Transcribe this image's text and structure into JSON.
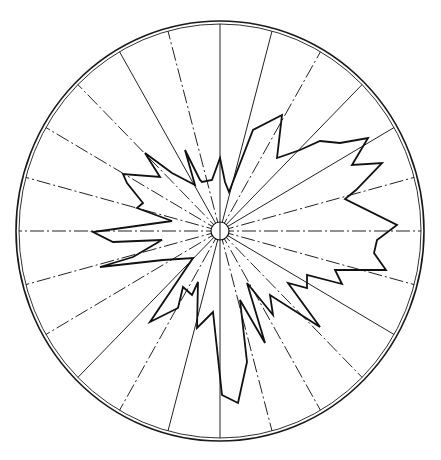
{
  "diagram": {
    "type": "polar-rose-diagram",
    "title": "",
    "center": [
      220,
      231
    ],
    "outer_radius_x": 204,
    "outer_radius_y": 210,
    "inner_ring_gap": 3,
    "hub_radius": 9,
    "spoke_count": 24,
    "spoke_step_deg": 15,
    "spokes_dashed": [
      false,
      false,
      true,
      false,
      false,
      true,
      true,
      true,
      false,
      true,
      true,
      true,
      false,
      false,
      true,
      false,
      true,
      true,
      true,
      true,
      true,
      true,
      false,
      true
    ],
    "colors": {
      "line": "#111111",
      "background": "#ffffff"
    },
    "rose_polygon": [
      [
        220,
        158
      ],
      [
        225,
        182
      ],
      [
        229,
        192
      ],
      [
        253,
        130
      ],
      [
        282,
        115
      ],
      [
        277,
        158
      ],
      [
        300,
        150
      ],
      [
        320,
        141
      ],
      [
        340,
        143
      ],
      [
        368,
        138
      ],
      [
        352,
        165
      ],
      [
        382,
        163
      ],
      [
        356,
        190
      ],
      [
        345,
        199
      ],
      [
        397,
        225
      ],
      [
        377,
        240
      ],
      [
        374,
        253
      ],
      [
        386,
        270
      ],
      [
        335,
        270
      ],
      [
        342,
        284
      ],
      [
        307,
        275
      ],
      [
        307,
        288
      ],
      [
        288,
        283
      ],
      [
        320,
        327
      ],
      [
        270,
        295
      ],
      [
        273,
        315
      ],
      [
        247,
        283
      ],
      [
        265,
        343
      ],
      [
        240,
        300
      ],
      [
        247,
        362
      ],
      [
        238,
        403
      ],
      [
        222,
        395
      ],
      [
        213,
        312
      ],
      [
        197,
        328
      ],
      [
        198,
        282
      ],
      [
        192,
        295
      ],
      [
        183,
        287
      ],
      [
        178,
        308
      ],
      [
        150,
        322
      ],
      [
        193,
        258
      ],
      [
        163,
        260
      ],
      [
        100,
        267
      ],
      [
        133,
        257
      ],
      [
        162,
        240
      ],
      [
        113,
        242
      ],
      [
        93,
        232
      ],
      [
        172,
        221
      ],
      [
        137,
        208
      ],
      [
        143,
        203
      ],
      [
        127,
        183
      ],
      [
        123,
        174
      ],
      [
        160,
        177
      ],
      [
        145,
        153
      ],
      [
        172,
        173
      ],
      [
        195,
        185
      ],
      [
        185,
        150
      ],
      [
        200,
        180
      ],
      [
        202,
        182
      ],
      [
        212,
        180
      ]
    ]
  }
}
